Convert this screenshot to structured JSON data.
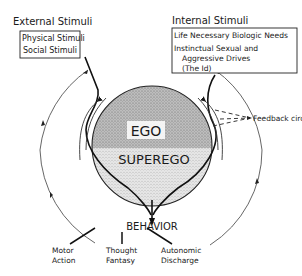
{
  "external": {
    "title": "External Stimuli",
    "items": [
      "Physical Stimuli",
      "Social Stimuli"
    ]
  },
  "internal": {
    "title": "Internal Stimuli",
    "items": [
      "Life Necessary Biologic Needs",
      "Instinctual Sexual and",
      "Aggressive Drives",
      "(The Id)"
    ]
  },
  "core": {
    "ego": "EGO",
    "superego": "SUPEREGO"
  },
  "feedback_label": "Feedback circuit",
  "behavior": {
    "title": "BEHAVIOR",
    "outputs": [
      {
        "line1": "Motor",
        "line2": "Action"
      },
      {
        "line1": "Thought",
        "line2": "Fantasy"
      },
      {
        "line1": "Autonomic",
        "line2": "Discharge"
      }
    ]
  }
}
